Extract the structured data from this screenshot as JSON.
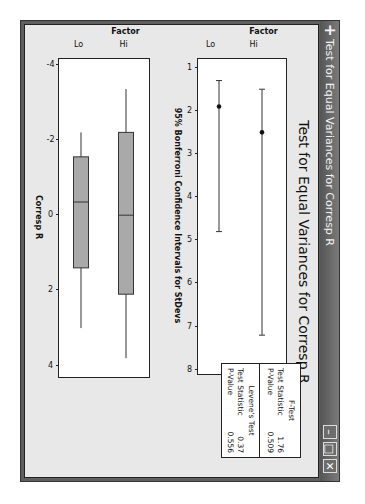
{
  "window": {
    "title": "Test for Equal Variances for Corresp R",
    "controls": {
      "minimize": "–",
      "maximize": "□",
      "close": "✕"
    },
    "orientation": "rotated 90 degrees clockwise"
  },
  "chart_title": "Test for Equal Variances for Corresp R",
  "legend": {
    "ftest": {
      "title": "F-Test",
      "stat_label": "Test Statistic",
      "stat_value": "1.76",
      "p_label": "P-Value",
      "p_value": "0.509"
    },
    "levene": {
      "title": "Levene's Test",
      "stat_label": "Test Statistic",
      "stat_value": "0.37",
      "p_label": "P-Value",
      "p_value": "0.556"
    }
  },
  "chart_data": [
    {
      "type": "interval",
      "title": "95% Bonferroni Confidence Intervals for StDevs",
      "ylabel": "Factor",
      "xlabel": "95% Bonferroni Confidence Intervals for StDevs",
      "categories": [
        "Lo",
        "Hi"
      ],
      "xticks": [
        "1",
        "2",
        "3",
        "4",
        "5",
        "6",
        "7",
        "8"
      ],
      "xlim": [
        0.8,
        8.1
      ],
      "series": [
        {
          "name": "Lo",
          "lower": 1.3,
          "estimate": 1.9,
          "upper": 4.8
        },
        {
          "name": "Hi",
          "lower": 1.5,
          "estimate": 2.5,
          "upper": 7.2
        }
      ],
      "grid": false
    },
    {
      "type": "boxplot",
      "ylabel": "Factor",
      "xlabel": "Corresp R",
      "categories": [
        "Lo",
        "Hi"
      ],
      "xticks": [
        "-4",
        "-2",
        "0",
        "2",
        "4"
      ],
      "xlim": [
        -4.15,
        4.3
      ],
      "series": [
        {
          "name": "Lo",
          "whisker_low": -2.2,
          "q1": -1.55,
          "median": -0.35,
          "q3": 1.4,
          "whisker_high": 3.0
        },
        {
          "name": "Hi",
          "whisker_low": -3.35,
          "q1": -2.2,
          "median": 0.0,
          "q3": 2.1,
          "whisker_high": 3.8
        }
      ],
      "grid": false
    }
  ],
  "colors": {
    "box_fill": "#a9a9a9",
    "titlebar": "#666666",
    "background": "#e8e8e8"
  }
}
